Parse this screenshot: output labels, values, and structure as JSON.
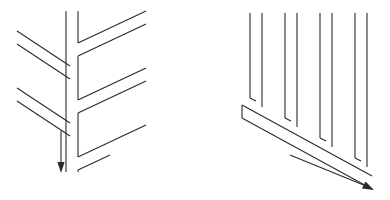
{
  "figure": {
    "background_color": "#ffffff",
    "stroke_color": "#2b2b2b",
    "stroke_width": 1.1,
    "canvas": {
      "width": 390,
      "height": 200
    },
    "panels": [
      {
        "id": "left-panel",
        "name": "chevron-herringbone-figure",
        "description": "Vertical spine with chevron branches and a downward arrow",
        "spine": {
          "left_line": {
            "x": 66,
            "y_top": 11,
            "y_bottom": 172
          },
          "right_line": {
            "x": 78,
            "y_top": 11,
            "y_bottom": 172
          }
        },
        "arrow": {
          "name": "down-arrow",
          "direction": "down",
          "x": 61,
          "y_start": 131,
          "y_end": 172
        },
        "left_branches": [
          {
            "points": "17,31 70,66"
          },
          {
            "points": "17,44 70,79"
          },
          {
            "points": "17,88 70,123"
          },
          {
            "points": "17,101 70,136"
          }
        ],
        "right_branches": [
          {
            "points": "78,43 146,11"
          },
          {
            "points": "78,56 146,24"
          },
          {
            "points": "78,100 146,68"
          },
          {
            "points": "78,113 146,81"
          },
          {
            "points": "78,157 146,125"
          }
        ]
      },
      {
        "id": "right-panel",
        "name": "vertical-bands-diagonal-figure",
        "description": "Four pairs of vertical lines descending along a diagonal baseline with a down-right arrow",
        "vertical_pairs": [
          {
            "x_left": 250,
            "x_right": 262,
            "y_top": 13,
            "y_bottom_left": 98,
            "y_bottom_right": 107
          },
          {
            "x_left": 285,
            "x_right": 297,
            "y_top": 13,
            "y_bottom_left": 118,
            "y_bottom_right": 127
          },
          {
            "x_left": 320,
            "x_right": 332,
            "y_top": 13,
            "y_bottom_left": 138,
            "y_bottom_right": 147
          },
          {
            "x_left": 355,
            "x_right": 367,
            "y_top": 13,
            "y_bottom_left": 158,
            "y_bottom_right": 167
          }
        ],
        "diagonal_lines": [
          {
            "points": "242,105 372,176"
          },
          {
            "points": "242,118 372,189"
          }
        ],
        "arrow": {
          "name": "down-right-arrow",
          "direction": "down-right",
          "x_start": 290,
          "y_start": 155,
          "x_end": 372,
          "y_end": 189
        }
      }
    ]
  }
}
